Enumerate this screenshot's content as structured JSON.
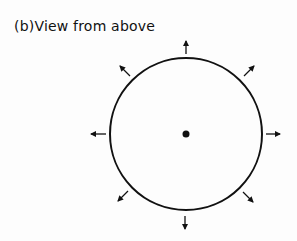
{
  "title": "(b)View from above",
  "diagram": {
    "center": [
      186,
      134
    ],
    "radius": 76,
    "center_dot_radius": 3.5,
    "arrow_directions": [
      "up",
      "up-right",
      "right",
      "down-right",
      "down",
      "down-left",
      "left",
      "up-left"
    ],
    "colors": {
      "stroke": "#111111",
      "background": "#fdfdfd"
    }
  }
}
